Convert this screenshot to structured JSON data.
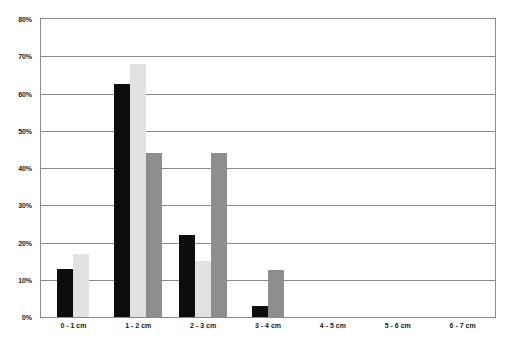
{
  "chart_data": {
    "type": "bar",
    "title": "",
    "subtitle": "",
    "xlabel": "",
    "ylabel": "",
    "grid": true,
    "legend": "none",
    "categories": [
      "0 - 1 cm",
      "1 - 2 cm",
      "2 - 3 cm",
      "3 - 4 cm",
      "4 - 5 cm",
      "5 - 6 cm",
      "6 - 7 cm"
    ],
    "ylim": [
      0,
      80
    ],
    "ytick_labels": [
      "80%",
      "70%",
      "60%",
      "50%",
      "40%",
      "30%",
      "20%",
      "10%",
      "0%"
    ],
    "ytick_values": [
      80,
      70,
      60,
      50,
      40,
      30,
      20,
      10,
      0
    ],
    "series": [
      {
        "name": "series-1",
        "color": "#0d0d0d",
        "values": [
          13,
          62.5,
          22,
          3,
          0,
          0,
          0
        ]
      },
      {
        "name": "series-2",
        "color": "#e2e2e2",
        "values": [
          17,
          68,
          15,
          0,
          0,
          0,
          0
        ]
      },
      {
        "name": "series-3",
        "color": "#8e8e8e",
        "values": [
          0,
          44,
          44,
          12.5,
          0,
          0,
          0
        ]
      }
    ]
  },
  "axes": {
    "y_ticks": [
      {
        "label": "80%",
        "value": 80
      },
      {
        "label": "70%",
        "value": 70
      },
      {
        "label": "60%",
        "value": 60
      },
      {
        "label": "50%",
        "value": 50
      },
      {
        "label": "40%",
        "value": 40
      },
      {
        "label": "30%",
        "value": 30
      },
      {
        "label": "20%",
        "value": 20
      },
      {
        "label": "10%",
        "value": 10
      },
      {
        "label": "0%",
        "value": 0
      }
    ],
    "x_ticks": [
      {
        "label": "0 - 1 cm"
      },
      {
        "label": "1 - 2 cm"
      },
      {
        "label": "2 - 3 cm"
      },
      {
        "label": "3 - 4 cm"
      },
      {
        "label": "4 - 5 cm"
      },
      {
        "label": "5 - 6 cm"
      },
      {
        "label": "6 - 7 cm"
      }
    ]
  }
}
